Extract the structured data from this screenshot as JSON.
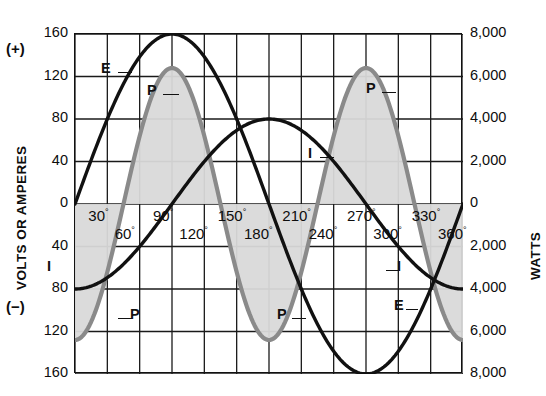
{
  "figure": {
    "left_axis_title": "VOLTS OR AMPERES",
    "right_axis_title": "WATTS",
    "sign_plus": "(+)",
    "sign_minus": "(−)"
  },
  "chart_data": {
    "type": "line",
    "title": "",
    "subtitle": "",
    "xlabel": "",
    "ylabel": "VOLTS OR AMPERES",
    "y2label": "WATTS",
    "xlim": [
      0,
      360
    ],
    "ylim": [
      -160,
      160
    ],
    "y2lim": [
      -8000,
      8000
    ],
    "grid": true,
    "legend": "inline-callouts",
    "x_major_step": 30,
    "y_major_step": 40,
    "y2_major_step": 2000,
    "xticks": [
      {
        "value": 30,
        "label": "30°",
        "row": "top"
      },
      {
        "value": 60,
        "label": "60°",
        "row": "bottom"
      },
      {
        "value": 90,
        "label": "90°",
        "row": "top"
      },
      {
        "value": 120,
        "label": "120°",
        "row": "bottom"
      },
      {
        "value": 150,
        "label": "150°",
        "row": "top"
      },
      {
        "value": 180,
        "label": "180°",
        "row": "bottom"
      },
      {
        "value": 210,
        "label": "210°",
        "row": "top"
      },
      {
        "value": 240,
        "label": "240°",
        "row": "bottom"
      },
      {
        "value": 270,
        "label": "270°",
        "row": "top"
      },
      {
        "value": 300,
        "label": "300°",
        "row": "bottom"
      },
      {
        "value": 330,
        "label": "330°",
        "row": "top"
      },
      {
        "value": 360,
        "label": "360°",
        "row": "bottom"
      }
    ],
    "yticks_left": [
      "160",
      "120",
      "80",
      "40",
      "0",
      "40",
      "80",
      "120",
      "160"
    ],
    "yticks_left_values": [
      160,
      120,
      80,
      40,
      0,
      -40,
      -80,
      -120,
      -160
    ],
    "yticks_right": [
      "8,000",
      "6,000",
      "4,000",
      "2,000",
      "0",
      "2,000",
      "4,000",
      "6,000",
      "8,000"
    ],
    "yticks_right_values": [
      8000,
      6000,
      4000,
      2000,
      0,
      -2000,
      -4000,
      -6000,
      -8000
    ],
    "series": [
      {
        "name": "E",
        "label": "E",
        "axis": "left",
        "color": "#111111",
        "width": 3.4,
        "kind": "sine",
        "amplitude": 160,
        "phase_deg": 0,
        "description": "Voltage sine wave, peak 160 V at 90°, zero at 0°/180°/360°, trough -160 V at 270°",
        "x": [
          0,
          10,
          20,
          30,
          40,
          50,
          60,
          70,
          80,
          90,
          100,
          110,
          120,
          130,
          140,
          150,
          160,
          170,
          180,
          190,
          200,
          210,
          220,
          230,
          240,
          250,
          260,
          270,
          280,
          290,
          300,
          310,
          320,
          330,
          340,
          350,
          360
        ],
        "y": [
          0,
          27.8,
          54.7,
          80,
          103,
          122.6,
          138.6,
          150.4,
          157.6,
          160,
          157.6,
          150.4,
          138.6,
          122.6,
          103,
          80,
          54.7,
          27.8,
          0,
          -27.8,
          -54.7,
          -80,
          -103,
          -122.6,
          -138.6,
          -150.4,
          -157.6,
          -160,
          -157.6,
          -150.4,
          -138.6,
          -122.6,
          -103,
          -80,
          -54.7,
          -27.8,
          0
        ]
      },
      {
        "name": "I",
        "label": "I",
        "axis": "left",
        "color": "#111111",
        "width": 3.4,
        "kind": "sine",
        "amplitude": 80,
        "phase_deg": -90,
        "description": "Current sine wave lagging voltage by 90°, peak 80 A at 180°, -80 A at 0°/360°",
        "x": [
          0,
          10,
          20,
          30,
          40,
          50,
          60,
          70,
          80,
          90,
          100,
          110,
          120,
          130,
          140,
          150,
          160,
          170,
          180,
          190,
          200,
          210,
          220,
          230,
          240,
          250,
          260,
          270,
          280,
          290,
          300,
          310,
          320,
          330,
          340,
          350,
          360
        ],
        "y": [
          -80,
          -78.8,
          -75.2,
          -69.3,
          -61.3,
          -51.4,
          -40,
          -27.4,
          -13.9,
          0,
          13.9,
          27.4,
          40,
          51.4,
          61.3,
          69.3,
          75.2,
          78.8,
          80,
          78.8,
          75.2,
          69.3,
          61.3,
          51.4,
          40,
          27.4,
          13.9,
          0,
          -13.9,
          -27.4,
          -40,
          -51.4,
          -61.3,
          -69.3,
          -75.2,
          -78.8,
          -80
        ]
      },
      {
        "name": "P",
        "label": "P",
        "axis": "right",
        "color": "#8a8a8a",
        "width": 4.2,
        "fill": "#d9d9d9",
        "kind": "product",
        "amplitude": 6400,
        "description": "Instantaneous power P = E × I, double frequency, alternating positive and negative lobes, peaks ~6,400 W at 135° and 315°, troughs ~-6,400 W at 45° and 225°",
        "x": [
          0,
          10,
          20,
          30,
          40,
          50,
          60,
          70,
          80,
          90,
          100,
          110,
          120,
          130,
          140,
          150,
          160,
          170,
          180,
          190,
          200,
          210,
          220,
          230,
          240,
          250,
          260,
          270,
          280,
          290,
          300,
          310,
          320,
          330,
          340,
          350,
          360
        ],
        "y": [
          0,
          -2190,
          -4114,
          -5543,
          -6314,
          -6302,
          -5543,
          -4121,
          -2190,
          0,
          2190,
          4121,
          5543,
          6302,
          6314,
          5543,
          4114,
          2190,
          0,
          -2190,
          -4114,
          -5543,
          -6314,
          -6302,
          -5543,
          -4121,
          -2190,
          0,
          2190,
          4121,
          5543,
          6302,
          6314,
          5543,
          4114,
          2190,
          0
        ]
      }
    ],
    "annotations": [
      {
        "text": "E",
        "series": "E",
        "x_deg": 52,
        "note": "upper-left rising voltage"
      },
      {
        "text": "P",
        "series": "P",
        "x_deg": 112,
        "note": "first positive power lobe"
      },
      {
        "text": "P",
        "series": "P",
        "x_deg": 300,
        "note": "third positive power lobe"
      },
      {
        "text": "P",
        "series": "P",
        "x_deg": 65,
        "note": "first negative power lobe"
      },
      {
        "text": "P",
        "series": "P",
        "x_deg": 196,
        "note": "second negative power lobe"
      },
      {
        "text": "I",
        "series": "I",
        "x_deg": 236,
        "note": "current crossing near 240°"
      },
      {
        "text": "I",
        "series": "I",
        "x_deg": 36,
        "note": "current lower-left"
      },
      {
        "text": "I",
        "series": "I",
        "x_deg": 320,
        "note": "current upper-right descending"
      },
      {
        "text": "E",
        "series": "E",
        "x_deg": 318,
        "note": "voltage lower-right rising"
      }
    ]
  }
}
